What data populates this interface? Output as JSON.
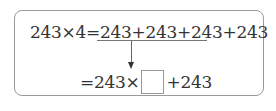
{
  "equation": {
    "line1": {
      "lhs": "243×4",
      "equals": "=",
      "underlined": "243+243+243",
      "rest": "+243"
    },
    "line2": {
      "prefix": "=243×",
      "blank_value": "",
      "suffix": "+243"
    }
  }
}
